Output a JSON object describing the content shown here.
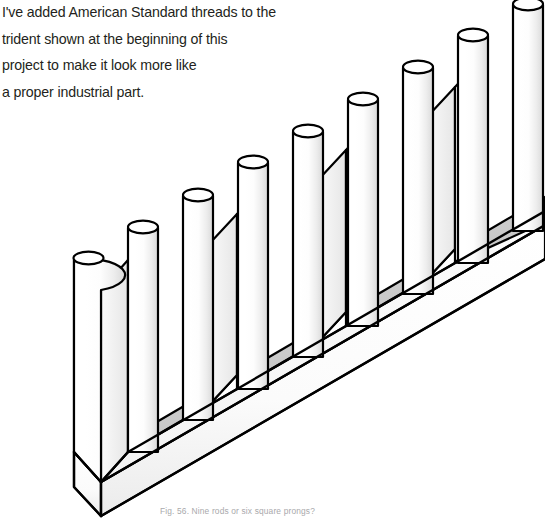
{
  "page": {
    "background_color": "#ffffff",
    "width": 545,
    "height": 521
  },
  "body_text": {
    "clipped_top_line": "the part by tapping a hole in the handle, just as I did for the",
    "lines": [
      "I've added American Standard threads to the",
      "trident shown at the beginning of this",
      "project to make it look more like",
      "a proper industrial part."
    ],
    "text_color": "#231f20"
  },
  "caption": {
    "text": "Fig. 56. Nine rods or six square prongs?",
    "figure_number": "Fig. 56.",
    "figure_title": "Nine rods or six square prongs?",
    "color": "#a9a9ac"
  },
  "figure": {
    "name": "impossible-trident",
    "rod_count": 9,
    "prong_count": 6,
    "projection": "isometric",
    "line_color": "#000000",
    "fill_color": "#ffffff",
    "slot_shade_color": "#cccccc",
    "slot_shade_color_dark": "#b8b8b8",
    "rods": [
      {
        "label": "rod-1",
        "x": 88,
        "top_y": 257,
        "radius": 15
      },
      {
        "label": "rod-2",
        "x": 143,
        "top_y": 226,
        "radius": 15
      },
      {
        "label": "rod-3",
        "x": 198,
        "top_y": 194,
        "radius": 15
      },
      {
        "label": "rod-4",
        "x": 253,
        "top_y": 161,
        "radius": 15
      },
      {
        "label": "rod-5",
        "x": 308,
        "top_y": 130,
        "radius": 15
      },
      {
        "label": "rod-6",
        "x": 363,
        "top_y": 98,
        "radius": 15
      },
      {
        "label": "rod-7",
        "x": 418,
        "top_y": 66,
        "radius": 15
      },
      {
        "label": "rod-8",
        "x": 473,
        "top_y": 34,
        "radius": 15
      },
      {
        "label": "rod-9",
        "x": 528,
        "top_y": 3,
        "radius": 15
      }
    ],
    "slots": [
      {
        "label": "slot-1",
        "bottom_y": 440
      },
      {
        "label": "slot-2",
        "bottom_y": 386
      },
      {
        "label": "slot-3",
        "bottom_y": 330
      },
      {
        "label": "slot-4",
        "bottom_y": 293
      },
      {
        "label": "slot-5",
        "bottom_y": 240
      }
    ]
  }
}
